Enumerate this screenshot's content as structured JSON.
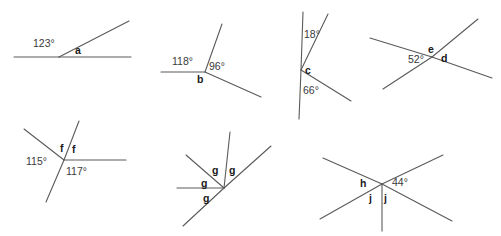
{
  "worksheet": {
    "title": "Angle diagrams worksheet",
    "width": 501,
    "height": 236,
    "background_color": "#ffffff",
    "line_color": "#5a5a5a",
    "label_color": "#2b2b2b"
  },
  "figures": [
    {
      "id": "figure-1",
      "name": "straight-line-with-ray",
      "description": "Horizontal straight line with one ray from a point, splitting the straight angle",
      "vertex": [
        59,
        57
      ],
      "rays": [
        {
          "name": "ray-left",
          "to": [
            14,
            57
          ]
        },
        {
          "name": "ray-right",
          "to": [
            131,
            57
          ]
        },
        {
          "name": "ray-up-right",
          "to": [
            129,
            21
          ]
        }
      ],
      "labels": [
        {
          "name": "angle-123",
          "text": "123°",
          "type": "degree",
          "x": 33,
          "y": 47
        },
        {
          "name": "angle-a",
          "text": "a",
          "type": "variable",
          "x": 75,
          "y": 54
        }
      ]
    },
    {
      "id": "figure-2",
      "name": "three-rays-vertex-b",
      "description": "Vertex with a horizontal left ray, an up-right ray and a down-right ray",
      "vertex": [
        205,
        72
      ],
      "rays": [
        {
          "name": "ray-left",
          "to": [
            161,
            72
          ]
        },
        {
          "name": "ray-up-right",
          "to": [
            222,
            24
          ]
        },
        {
          "name": "ray-down-right",
          "to": [
            261,
            97
          ]
        }
      ],
      "labels": [
        {
          "name": "angle-118",
          "text": "118°",
          "type": "degree",
          "x": 172,
          "y": 65
        },
        {
          "name": "angle-96",
          "text": "96°",
          "type": "degree",
          "x": 209,
          "y": 70
        },
        {
          "name": "angle-b",
          "text": "b",
          "type": "variable",
          "x": 197,
          "y": 83
        }
      ]
    },
    {
      "id": "figure-3",
      "name": "vertical-line-two-rays-vertex-c",
      "description": "Vertical straight line with two rays to the right from the same point",
      "vertex": [
        301,
        70
      ],
      "rays": [
        {
          "name": "ray-up",
          "to": [
            303,
            12
          ]
        },
        {
          "name": "ray-down",
          "to": [
            299,
            119
          ]
        },
        {
          "name": "ray-up-right",
          "to": [
            328,
            14
          ]
        },
        {
          "name": "ray-down-right",
          "to": [
            351,
            101
          ]
        }
      ],
      "labels": [
        {
          "name": "angle-18",
          "text": "18°",
          "type": "degree",
          "x": 304,
          "y": 38
        },
        {
          "name": "angle-c",
          "text": "c",
          "type": "variable",
          "x": 305,
          "y": 74
        },
        {
          "name": "angle-66",
          "text": "66°",
          "type": "degree",
          "x": 303,
          "y": 94
        }
      ]
    },
    {
      "id": "figure-4",
      "name": "crossing-lines-vertex-ed",
      "description": "Two straight lines crossing, vertically opposite angles",
      "vertex": [
        432,
        57
      ],
      "rays": [
        {
          "name": "line-1-left",
          "to": [
            370,
            38
          ]
        },
        {
          "name": "line-1-right",
          "to": [
            492,
            78
          ]
        },
        {
          "name": "line-2-lower-left",
          "to": [
            383,
            89
          ]
        },
        {
          "name": "line-2-upper-right",
          "to": [
            478,
            19
          ]
        }
      ],
      "labels": [
        {
          "name": "angle-52",
          "text": "52°",
          "type": "degree",
          "x": 408,
          "y": 63
        },
        {
          "name": "angle-e",
          "text": "e",
          "type": "variable",
          "x": 428,
          "y": 53
        },
        {
          "name": "angle-d",
          "text": "d",
          "type": "variable",
          "x": 441,
          "y": 62
        }
      ]
    },
    {
      "id": "figure-5",
      "name": "four-rays-vertex-f",
      "description": "Vertex with an up-left ray, a line through it and a horizontal right ray",
      "vertex": [
        64,
        160
      ],
      "rays": [
        {
          "name": "ray-up-left",
          "to": [
            24,
            129
          ]
        },
        {
          "name": "ray-up-right-steep",
          "to": [
            79,
            121
          ]
        },
        {
          "name": "ray-down-left-steep",
          "to": [
            46,
            202
          ]
        },
        {
          "name": "ray-right",
          "to": [
            126,
            160
          ]
        }
      ],
      "labels": [
        {
          "name": "angle-f-left",
          "text": "f",
          "type": "variable",
          "x": 60,
          "y": 152
        },
        {
          "name": "angle-f-right",
          "text": "f",
          "type": "variable",
          "x": 72,
          "y": 153
        },
        {
          "name": "angle-115",
          "text": "115°",
          "type": "degree",
          "x": 26,
          "y": 165
        },
        {
          "name": "angle-117",
          "text": "117°",
          "type": "degree",
          "x": 66,
          "y": 175
        }
      ]
    },
    {
      "id": "figure-6",
      "name": "five-rays-vertex-g",
      "description": "Vertex with four g angles around a horizontal ray and a diagonal line",
      "vertex": [
        224,
        188
      ],
      "rays": [
        {
          "name": "ray-left-horizontal",
          "to": [
            177,
            188
          ]
        },
        {
          "name": "ray-up-left-diagonal",
          "to": [
            186,
            155
          ]
        },
        {
          "name": "ray-up-steep",
          "to": [
            230,
            132
          ]
        },
        {
          "name": "ray-up-right-diagonal",
          "to": [
            271,
            146
          ]
        },
        {
          "name": "ray-down-left-diagonal",
          "to": [
            183,
            226
          ]
        }
      ],
      "labels": [
        {
          "name": "angle-g-upper-left",
          "text": "g",
          "type": "variable",
          "x": 212,
          "y": 174
        },
        {
          "name": "angle-g-upper-right",
          "text": "g",
          "type": "variable",
          "x": 229,
          "y": 174
        },
        {
          "name": "angle-g-left",
          "text": "g",
          "type": "variable",
          "x": 201,
          "y": 187
        },
        {
          "name": "angle-g-lower",
          "text": "g",
          "type": "variable",
          "x": 203,
          "y": 202
        }
      ]
    },
    {
      "id": "figure-7",
      "name": "crossing-lines-with-ray-vertex-hj",
      "description": "Two crossing straight lines plus a vertical ray going down",
      "vertex": [
        382,
        184
      ],
      "rays": [
        {
          "name": "line-1-upper-left",
          "to": [
            323,
            158
          ]
        },
        {
          "name": "line-1-lower-right",
          "to": [
            452,
            221
          ]
        },
        {
          "name": "line-2-lower-left",
          "to": [
            320,
            219
          ]
        },
        {
          "name": "line-2-upper-right",
          "to": [
            443,
            155
          ]
        },
        {
          "name": "ray-down-vertical",
          "to": [
            382,
            231
          ]
        }
      ],
      "labels": [
        {
          "name": "angle-h",
          "text": "h",
          "type": "variable",
          "x": 360,
          "y": 187
        },
        {
          "name": "angle-44",
          "text": "44°",
          "type": "degree",
          "x": 392,
          "y": 186
        },
        {
          "name": "angle-j-left",
          "text": "j",
          "type": "variable",
          "x": 369,
          "y": 202
        },
        {
          "name": "angle-j-right",
          "text": "j",
          "type": "variable",
          "x": 384,
          "y": 202
        }
      ]
    }
  ]
}
